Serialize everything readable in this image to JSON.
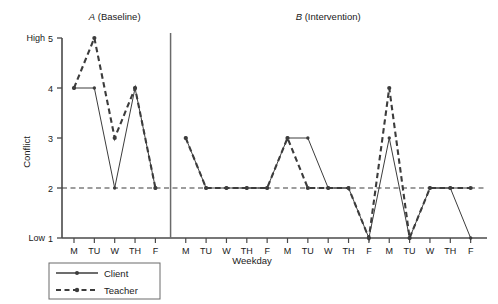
{
  "chart_data": {
    "type": "line",
    "title": "",
    "xlabel": "Weekday",
    "ylabel": "Conflict",
    "ylim": [
      1,
      5
    ],
    "yticks": [
      1,
      2,
      3,
      4,
      5
    ],
    "ytick_labels": [
      "1",
      "2",
      "3",
      "4",
      "5"
    ],
    "y_low_label": "Low",
    "y_high_label": "High",
    "grid": false,
    "reference_line": {
      "y": 2,
      "style": "dashed"
    },
    "legend_position": "below-left",
    "x": [
      "M",
      "TU",
      "W",
      "TH",
      "F",
      "M",
      "TU",
      "W",
      "TH",
      "F",
      "M",
      "TU",
      "W",
      "TH",
      "F",
      "M",
      "TU",
      "W",
      "TH",
      "F"
    ],
    "categories": [
      "M",
      "TU",
      "W",
      "TH",
      "F",
      "M",
      "TU",
      "W",
      "TH",
      "F",
      "M",
      "TU",
      "W",
      "TH",
      "F",
      "M",
      "TU",
      "W",
      "TH",
      "F"
    ],
    "phases": [
      {
        "label": "A (Baseline)",
        "label_italic": "A",
        "label_rest": " (Baseline)",
        "start_index": 0,
        "end_index": 4
      },
      {
        "label": "B (Intervention)",
        "label_italic": "B",
        "label_rest": " (Intervention)",
        "start_index": 5,
        "end_index": 19
      }
    ],
    "phase_divider_after_index": 4,
    "series": [
      {
        "name": "Client",
        "style": "solid",
        "marker": "dot",
        "color": "#3c3c3c",
        "values": [
          4,
          4,
          2,
          4,
          2,
          3,
          2,
          2,
          2,
          2,
          3,
          3,
          2,
          2,
          1,
          3,
          1,
          2,
          2,
          1
        ]
      },
      {
        "name": "Teacher",
        "style": "dashed",
        "marker": "dot",
        "color": "#3c3c3c",
        "values": [
          4,
          5,
          3,
          4,
          2,
          3,
          2,
          2,
          2,
          2,
          3,
          2,
          2,
          2,
          1,
          4,
          1,
          2,
          2,
          2
        ]
      }
    ]
  },
  "legend": {
    "items": [
      {
        "label": "Client",
        "style": "solid"
      },
      {
        "label": "Teacher",
        "style": "dashed"
      }
    ]
  }
}
